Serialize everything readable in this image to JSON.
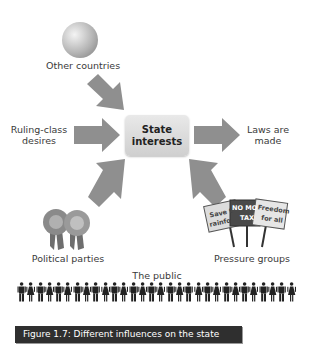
{
  "diagram": {
    "center": {
      "label_line1": "State",
      "label_line2": "interests"
    },
    "inputs": [
      {
        "id": "other-countries",
        "label": "Other countries",
        "icon": "globe-icon",
        "arrow_direction": "down-right"
      },
      {
        "id": "ruling-class",
        "label_line1": "Ruling-class",
        "label_line2": "desires",
        "arrow_direction": "right"
      },
      {
        "id": "political-parties",
        "label": "Political parties",
        "icon": "rosettes-icon",
        "arrow_direction": "up-right"
      },
      {
        "id": "pressure-groups",
        "label": "Pressure groups",
        "icon": "protest-placards-icon",
        "arrow_direction": "up-left"
      }
    ],
    "output": {
      "label_line1": "Laws are",
      "label_line2": "made",
      "arrow_direction": "right"
    },
    "placards": [
      "Save t rainfo",
      "NO MO TAX",
      "Freedom for all"
    ],
    "public": {
      "label": "The public",
      "figure_count": 30
    },
    "arrow_color": "#8f8f8f"
  },
  "caption": {
    "text": "Figure 1.7: Different influences on the state",
    "bg_color": "#2f2f2f"
  }
}
